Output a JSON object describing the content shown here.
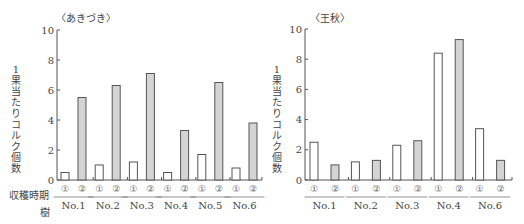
{
  "chart_data": [
    {
      "type": "bar",
      "title": "〈あきづき〉",
      "ylabel": "1果当たりコルク個数",
      "xlabel_rows": [
        "収穫時期",
        "樹"
      ],
      "ylim": [
        0,
        10
      ],
      "yticks": [
        0,
        2,
        4,
        6,
        8,
        10
      ],
      "categories": [
        "No.1",
        "No.2",
        "No.3",
        "No.4",
        "No.5",
        "No.6"
      ],
      "series": [
        {
          "name": "①",
          "fill": "#ffffff",
          "values": [
            0.5,
            1.0,
            1.2,
            0.5,
            1.7,
            0.8
          ]
        },
        {
          "name": "②",
          "fill": "#d4d4d4",
          "values": [
            5.5,
            6.3,
            7.1,
            3.3,
            6.5,
            3.8
          ]
        }
      ],
      "grid": false
    },
    {
      "type": "bar",
      "title": "〈王秋〉",
      "ylabel": "1果当たりコルク個数",
      "ylim": [
        0,
        10
      ],
      "yticks": [
        0,
        2,
        4,
        6,
        8,
        10
      ],
      "categories": [
        "No.1",
        "No.2",
        "No.3",
        "No.4",
        "No.6"
      ],
      "series": [
        {
          "name": "①",
          "fill": "#ffffff",
          "values": [
            2.5,
            1.2,
            2.3,
            8.4,
            3.4
          ]
        },
        {
          "name": "②",
          "fill": "#d4d4d4",
          "values": [
            1.0,
            1.3,
            2.6,
            9.3,
            1.3
          ]
        }
      ],
      "grid": false
    }
  ],
  "labels": {
    "left_title": "〈あきづき〉",
    "right_title": "〈王秋〉",
    "ylabel": "1果当たりコルク個数",
    "harvest_row": "収穫時期",
    "tree_row": "樹"
  }
}
